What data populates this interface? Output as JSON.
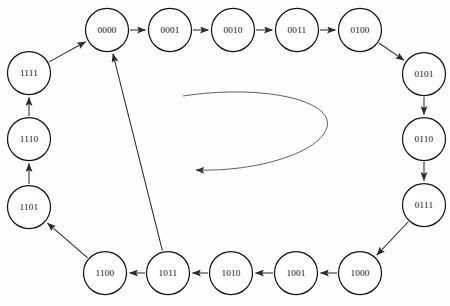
{
  "diagram": {
    "background_color": "#fefefe",
    "node_fill": "#ffffff",
    "node_stroke": "#141414",
    "edge_color": "#2b2b2b",
    "curve_color": "#55555c",
    "node_radius": 21.5,
    "nodes": [
      {
        "id": "n0000",
        "label": "0000",
        "cx": 107,
        "cy": 30
      },
      {
        "id": "n0001",
        "label": "0001",
        "cx": 170,
        "cy": 30
      },
      {
        "id": "n0010",
        "label": "0010",
        "cx": 233,
        "cy": 30
      },
      {
        "id": "n0011",
        "label": "0011",
        "cx": 297,
        "cy": 30
      },
      {
        "id": "n0100",
        "label": "0100",
        "cx": 360,
        "cy": 30
      },
      {
        "id": "n0101",
        "label": "0101",
        "cx": 424,
        "cy": 74
      },
      {
        "id": "n0110",
        "label": "0110",
        "cx": 424,
        "cy": 139
      },
      {
        "id": "n0111",
        "label": "0111",
        "cx": 424,
        "cy": 205
      },
      {
        "id": "n1000",
        "label": "1000",
        "cx": 360,
        "cy": 273
      },
      {
        "id": "n1001",
        "label": "1001",
        "cx": 296,
        "cy": 273
      },
      {
        "id": "n1010",
        "label": "1010",
        "cx": 231,
        "cy": 273
      },
      {
        "id": "n1011",
        "label": "1011",
        "cx": 168,
        "cy": 273
      },
      {
        "id": "n1100",
        "label": "1100",
        "cx": 105,
        "cy": 273
      },
      {
        "id": "n1101",
        "label": "1101",
        "cx": 29,
        "cy": 207
      },
      {
        "id": "n1110",
        "label": "1110",
        "cx": 29,
        "cy": 139
      },
      {
        "id": "n1111",
        "label": "1111",
        "cx": 29,
        "cy": 73
      }
    ],
    "edges": [
      {
        "id": "e0",
        "from": "0000",
        "to": "0001",
        "kind": "straight"
      },
      {
        "id": "e1",
        "from": "0001",
        "to": "0010",
        "kind": "straight"
      },
      {
        "id": "e2",
        "from": "0010",
        "to": "0011",
        "kind": "straight"
      },
      {
        "id": "e3",
        "from": "0011",
        "to": "0100",
        "kind": "straight"
      },
      {
        "id": "e4",
        "from": "0100",
        "to": "0101",
        "kind": "straight"
      },
      {
        "id": "e5",
        "from": "0101",
        "to": "0110",
        "kind": "straight"
      },
      {
        "id": "e6",
        "from": "0110",
        "to": "0111",
        "kind": "straight"
      },
      {
        "id": "e7",
        "from": "0111",
        "to": "1000",
        "kind": "straight"
      },
      {
        "id": "e8",
        "from": "1000",
        "to": "1001",
        "kind": "straight"
      },
      {
        "id": "e9",
        "from": "1001",
        "to": "1010",
        "kind": "straight"
      },
      {
        "id": "e10",
        "from": "1010",
        "to": "1011",
        "kind": "straight"
      },
      {
        "id": "e11",
        "from": "1011",
        "to": "1100",
        "kind": "straight"
      },
      {
        "id": "e12",
        "from": "1100",
        "to": "1101",
        "kind": "straight"
      },
      {
        "id": "e13",
        "from": "1101",
        "to": "1110",
        "kind": "straight"
      },
      {
        "id": "e14",
        "from": "1110",
        "to": "1111",
        "kind": "straight"
      },
      {
        "id": "e15",
        "from": "1111",
        "to": "0000",
        "kind": "straight"
      },
      {
        "id": "e16",
        "from": "1011",
        "to": "0000",
        "kind": "reset-diagonal"
      },
      {
        "id": "e17",
        "from": "",
        "to": "",
        "kind": "free-curve",
        "note": "unlabeled curved arrow in center pointing left"
      }
    ]
  }
}
